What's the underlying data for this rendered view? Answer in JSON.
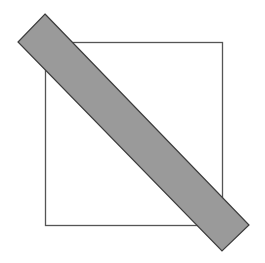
{
  "diagram": {
    "width": 265,
    "height": 263,
    "square": {
      "x": 45.5,
      "y": 42.5,
      "width": 177,
      "height": 183,
      "stroke": "#555555",
      "stroke_width": 1.3,
      "fill": "none"
    },
    "band": {
      "points": "45,14 249,225 222,251 18,42",
      "fill": "#9a9a9a",
      "stroke": "#3c3c3c",
      "stroke_width": 1.2
    }
  }
}
